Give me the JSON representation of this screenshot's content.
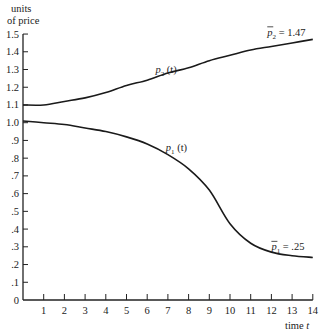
{
  "chart_data": {
    "type": "line",
    "title": "",
    "ylabel": "units of price",
    "xlabel": "time t",
    "xlim": [
      0,
      14
    ],
    "ylim": [
      0,
      1.5
    ],
    "grid": false,
    "x_ticks": [
      "1",
      "2",
      "3",
      "4",
      "5",
      "6",
      "7",
      "8",
      "9",
      "10",
      "11",
      "12",
      "13",
      "14"
    ],
    "y_ticks": [
      {
        "v": 0,
        "label": "0"
      },
      {
        "v": 0.1,
        "label": ".1"
      },
      {
        "v": 0.2,
        "label": ".2"
      },
      {
        "v": 0.3,
        "label": ".3"
      },
      {
        "v": 0.4,
        "label": ".4"
      },
      {
        "v": 0.5,
        "label": ".5"
      },
      {
        "v": 0.6,
        "label": ".6"
      },
      {
        "v": 0.7,
        "label": ".7"
      },
      {
        "v": 0.8,
        "label": ".8"
      },
      {
        "v": 0.9,
        "label": ".9"
      },
      {
        "v": 1.0,
        "label": "1.0"
      },
      {
        "v": 1.1,
        "label": "1.1"
      },
      {
        "v": 1.2,
        "label": "1.2"
      },
      {
        "v": 1.3,
        "label": "1.3"
      },
      {
        "v": 1.4,
        "label": "1.4"
      },
      {
        "v": 1.5,
        "label": "1.5"
      }
    ],
    "x": [
      0,
      1,
      2,
      3,
      4,
      5,
      6,
      7,
      8,
      9,
      10,
      11,
      12,
      13,
      14
    ],
    "series": [
      {
        "name": "p2(t)",
        "values": [
          1.1,
          1.1,
          1.12,
          1.14,
          1.17,
          1.21,
          1.24,
          1.28,
          1.31,
          1.35,
          1.38,
          1.41,
          1.43,
          1.45,
          1.47
        ]
      },
      {
        "name": "p1(t)",
        "values": [
          1.01,
          1.0,
          0.99,
          0.97,
          0.95,
          0.92,
          0.88,
          0.82,
          0.74,
          0.62,
          0.43,
          0.32,
          0.27,
          0.25,
          0.24
        ]
      }
    ],
    "annotations": [
      {
        "text_main": "p",
        "sub": "2",
        "bar": false,
        "rest": " (t)",
        "x": 6.4,
        "y": 1.28
      },
      {
        "text_main": "p",
        "sub": "2",
        "bar": true,
        "rest": " = 1.47",
        "x": 11.8,
        "y": 1.49
      },
      {
        "text_main": "p",
        "sub": "1",
        "bar": false,
        "rest": " (t)",
        "x": 6.9,
        "y": 0.84
      },
      {
        "text_main": "p",
        "sub": "1",
        "bar": true,
        "rest": " = .25",
        "x": 12.0,
        "y": 0.28
      }
    ]
  },
  "labels": {
    "ylabel_line1": "units",
    "ylabel_line2": "of price",
    "xlabel_time": "time",
    "xlabel_var": "t"
  }
}
